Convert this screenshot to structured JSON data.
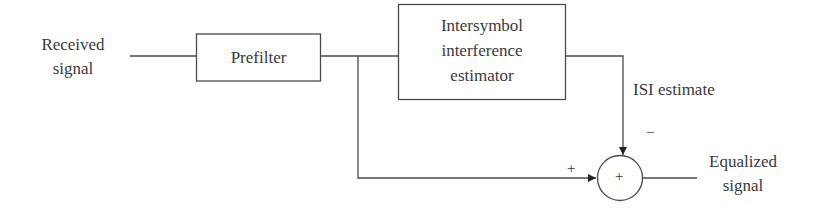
{
  "diagram": {
    "type": "block-diagram",
    "input": {
      "line1": "Received",
      "line2": "signal"
    },
    "blocks": {
      "prefilter": {
        "label": "Prefilter"
      },
      "isi_estimator": {
        "line1": "Intersymbol",
        "line2": "interference",
        "line3": "estimator"
      }
    },
    "signals": {
      "isi_estimate": "ISI estimate"
    },
    "summer": {
      "symbol": "+",
      "input_plus": "+",
      "input_minus": "−"
    },
    "output": {
      "line1": "Equalized",
      "line2": "signal"
    },
    "colors": {
      "stroke": "#4a4a4a",
      "text": "#3a3a3a",
      "background": "#ffffff"
    }
  }
}
